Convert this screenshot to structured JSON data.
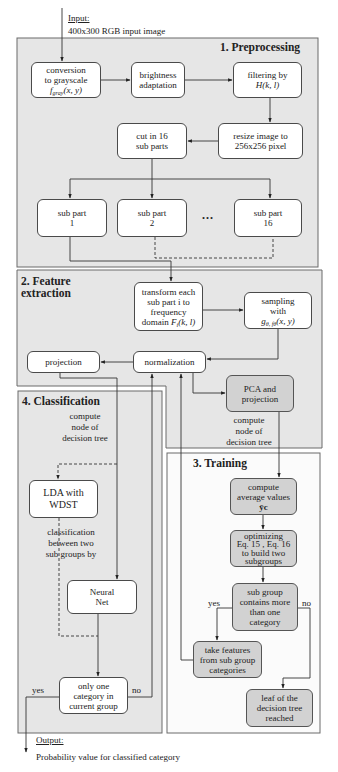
{
  "input": {
    "label": "Input:",
    "description": "400x300 RGB input image"
  },
  "output": {
    "label": "Output:",
    "description": "Probability value for classified category"
  },
  "sections": {
    "preprocessing": {
      "title": "1. Preprocessing"
    },
    "feature_extraction": {
      "title_line1": "2. Feature",
      "title_line2": "extraction"
    },
    "training": {
      "title": "3. Training"
    },
    "classification": {
      "title": "4. Classification"
    }
  },
  "nodes": {
    "grayscale": {
      "line1": "conversion",
      "line2": "to grayscale",
      "math_base": "f",
      "math_sub": "gray",
      "math_args": "(x, y)"
    },
    "brightness": {
      "line1": "brightness",
      "line2": "adaptation"
    },
    "filtering": {
      "line1": "filtering by",
      "math": "H(k, l)"
    },
    "resize": {
      "line1": "resize image to",
      "line2": "256x256 pixel"
    },
    "cut": {
      "line1": "cut in 16",
      "line2": "sub parts"
    },
    "sub_parts": [
      {
        "line1": "sub part",
        "line2": "1"
      },
      {
        "line1": "sub part",
        "line2": "2"
      },
      {
        "line1": "sub part",
        "line2": "16"
      }
    ],
    "ellipsis": "...",
    "transform": {
      "line1": "transform each",
      "line2": "sub part i to",
      "line3": "frequency",
      "prefix": "domain",
      "math_base": "F",
      "math_sub": "i",
      "math_args": "(k, l)"
    },
    "sampling": {
      "line1": "sampling",
      "line2": "with",
      "math_base": "g",
      "math_sub": "θ, fθ",
      "math_args": "(x, y)"
    },
    "projection": {
      "line1": "projection"
    },
    "normalization": {
      "line1": "normalization"
    },
    "pca": {
      "line1": "PCA and",
      "line2": "projection"
    },
    "compute_avg": {
      "line1": "compute",
      "line2": "average values",
      "math": "ȳc"
    },
    "optimizing": {
      "line1": "optimizing",
      "line2": "Eq. 15 , Eq. 16",
      "line3": "to build two",
      "line4": "subgroups"
    },
    "subgroup_check": {
      "line1": "sub group",
      "line2": "contains more",
      "line3": "than one",
      "line4": "category"
    },
    "take_features": {
      "line1": "take features",
      "line2": "from sub group",
      "line3": "categories"
    },
    "leaf": {
      "line1": "leaf of the",
      "line2": "decision tree",
      "line3": "reached"
    },
    "lda": {
      "line1": "LDA with",
      "line2": "WDST"
    },
    "neural_net": {
      "line1": "Neural",
      "line2": "Net"
    },
    "only_one": {
      "line1": "only one",
      "line2": "category in",
      "line3": "current group"
    }
  },
  "notes": {
    "training_compute_node": {
      "line1": "compute",
      "line2": "node of",
      "line3": "decision tree"
    },
    "classification_compute_node": {
      "line1": "compute",
      "line2": "node of",
      "line3": "decision tree"
    },
    "classification_between": {
      "line1": "classification",
      "line2": "between two",
      "line3": "sub groups by"
    }
  },
  "edge_labels": {
    "training_yes": "yes",
    "training_no": "no",
    "classification_yes": "yes",
    "classification_no": "no"
  },
  "colors": {
    "section_fill": "#e6e6e6",
    "training_fill": "#fbfbfb",
    "gray_node_fill": "#d2d2d2",
    "white_node_fill": "#ffffff",
    "stroke": "#4a4a4a"
  }
}
